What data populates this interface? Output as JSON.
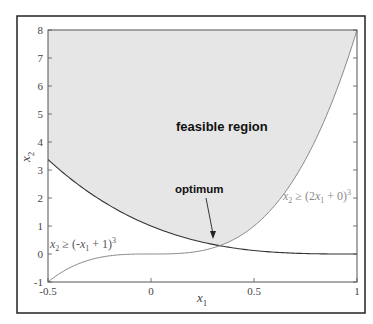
{
  "chart_data": {
    "type": "area",
    "title": "",
    "xlabel": "x1",
    "ylabel": "x2",
    "xlim": [
      -0.5,
      1
    ],
    "ylim": [
      -1,
      8
    ],
    "x_ticks": [
      -0.5,
      0,
      0.5,
      1
    ],
    "x_tick_labels": [
      "-0.5",
      "0",
      "0.5",
      "1"
    ],
    "y_ticks": [
      -1,
      0,
      1,
      2,
      3,
      4,
      5,
      6,
      7,
      8
    ],
    "y_tick_labels": [
      "-1",
      "0",
      "1",
      "2",
      "3",
      "4",
      "5",
      "6",
      "7",
      "8"
    ],
    "grid": false,
    "series": [
      {
        "name": "x2 ≥ (-x1 + 1)^3",
        "function": "(-x1+1)^3",
        "x": [
          -0.5,
          -0.25,
          0,
          0.25,
          0.3333,
          0.5,
          0.75,
          1
        ],
        "values": [
          3.375,
          1.953,
          1.0,
          0.422,
          0.296,
          0.125,
          0.016,
          0.0
        ]
      },
      {
        "name": "x2 ≥ (2x1 + 0)^3",
        "function": "(2*x1+0)^3",
        "x": [
          -0.5,
          -0.25,
          0,
          0.25,
          0.3333,
          0.5,
          0.75,
          1
        ],
        "values": [
          -1.0,
          -0.125,
          0.0,
          0.125,
          0.296,
          1.0,
          3.375,
          8.0
        ]
      }
    ],
    "shaded_region": "feasible region (above both curves)",
    "annotations": [
      {
        "text": "feasible region",
        "x": 0.05,
        "y": 5.2
      },
      {
        "text": "optimum",
        "x": 0.25,
        "y": 1.6,
        "arrow_to": [
          0.3333,
          0.296
        ]
      },
      {
        "text": "x2 ≥ (-x1 + 1)^3",
        "x": -0.48,
        "y": 1.3
      },
      {
        "text": "x2 ≥ (2x1 + 0)^3",
        "x": 0.7,
        "y": 2.05
      }
    ]
  },
  "labels": {
    "feasible": "feasible region",
    "optimum": "optimum",
    "xlabel_main": "x",
    "xlabel_sub": "1",
    "ylabel_main": "x",
    "ylabel_sub": "2",
    "constraint1": {
      "a": "x",
      "a_sub": "2",
      "b": " ≥ (-",
      "c": "x",
      "c_sub": "1",
      "d": " + 1)",
      "sup": "3"
    },
    "constraint2": {
      "a": "x",
      "a_sub": "2",
      "b": " ≥ (2",
      "c": "x",
      "c_sub": "1",
      "d": " + 0)",
      "sup": "3"
    }
  },
  "colors": {
    "feasible_fill": "#e6e6e6",
    "curve1": "#333333",
    "curve2": "#8a8a8a",
    "axis": "#555555",
    "frame": "#222222"
  }
}
